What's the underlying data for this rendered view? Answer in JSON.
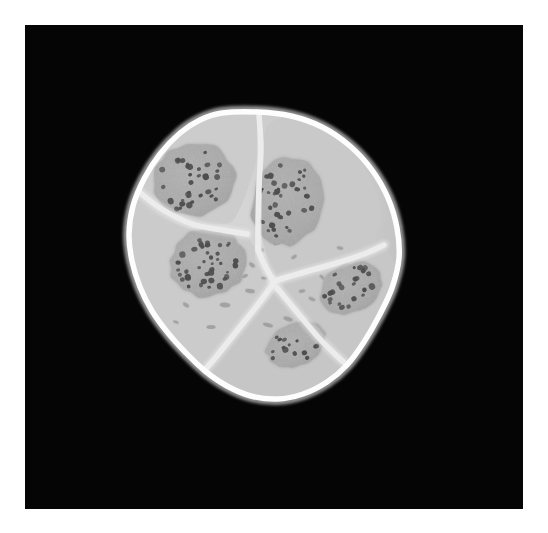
{
  "figure": {
    "modality": "grayscale light micrograph",
    "caption": "Cross-section of a five-celled embryo showing blastomeres separated by bright cell membranes, each containing a single darker nucleus with dense chromatin granules."
  },
  "canvas": {
    "width": 548,
    "height": 533,
    "page_background": "#ffffff"
  },
  "plate": {
    "x": 25,
    "y": 25,
    "width": 498,
    "height": 484,
    "background_color": "#050505",
    "label": "black specimen plate"
  },
  "palette": {
    "background_black": "#050505",
    "membrane_white": "#fdfdfd",
    "membrane_glow": "#f2f2f2",
    "cytoplasm_light": "#d2d2d2",
    "cytoplasm_mid": "#c4c4c4",
    "cytoplasm_shade": "#b4b4b4",
    "nucleus_fill": "#9a9a9a",
    "nucleus_edge": "#8d8d8d",
    "chromatin_dot": "#1a1a1a",
    "granule_speck": "#7c7c7c"
  },
  "specimen": {
    "name": "embryo-cluster",
    "outline_label": "embryo outer boundary",
    "center_x": 265,
    "center_y": 255,
    "bounds": {
      "x_min": 128,
      "y_min": 112,
      "x_max": 400,
      "y_max": 400
    },
    "outline_points": [
      [
        222,
        113
      ],
      [
        258,
        112
      ],
      [
        291,
        116
      ],
      [
        322,
        127
      ],
      [
        350,
        146
      ],
      [
        372,
        170
      ],
      [
        388,
        198
      ],
      [
        397,
        228
      ],
      [
        399,
        258
      ],
      [
        392,
        288
      ],
      [
        379,
        316
      ],
      [
        364,
        342
      ],
      [
        347,
        365
      ],
      [
        327,
        382
      ],
      [
        303,
        394
      ],
      [
        277,
        399
      ],
      [
        251,
        396
      ],
      [
        227,
        386
      ],
      [
        205,
        371
      ],
      [
        186,
        353
      ],
      [
        168,
        333
      ],
      [
        152,
        311
      ],
      [
        140,
        287
      ],
      [
        132,
        261
      ],
      [
        129,
        234
      ],
      [
        133,
        206
      ],
      [
        144,
        179
      ],
      [
        160,
        154
      ],
      [
        180,
        133
      ],
      [
        200,
        120
      ]
    ],
    "membrane_thickness": 5.5,
    "triple_junction": {
      "x": 275,
      "y": 283,
      "label": "central triple junction"
    }
  },
  "cells": [
    {
      "id": "cell-upper-left",
      "label": "Blastomere 1 (upper-left)",
      "cytoplasm_tone": "#cfcfcf",
      "region_points": [
        [
          200,
          121
        ],
        [
          228,
          114
        ],
        [
          252,
          117
        ],
        [
          264,
          130
        ],
        [
          258,
          155
        ],
        [
          250,
          182
        ],
        [
          241,
          206
        ],
        [
          231,
          222
        ],
        [
          212,
          224
        ],
        [
          188,
          220
        ],
        [
          163,
          212
        ],
        [
          145,
          201
        ],
        [
          138,
          186
        ],
        [
          142,
          166
        ],
        [
          155,
          145
        ],
        [
          173,
          129
        ]
      ],
      "nucleus": {
        "id": "nucleus-1",
        "label": "nucleus of upper-left blastomere",
        "cx": 194,
        "cy": 180,
        "rx": 41,
        "ry": 36,
        "rotation": -18,
        "chromatin_count": 34
      }
    },
    {
      "id": "cell-upper-right",
      "label": "Blastomere 2 (upper-right)",
      "cytoplasm_tone": "#cacaca",
      "region_points": [
        [
          266,
          129
        ],
        [
          283,
          118
        ],
        [
          310,
          123
        ],
        [
          338,
          140
        ],
        [
          360,
          163
        ],
        [
          375,
          190
        ],
        [
          381,
          216
        ],
        [
          374,
          240
        ],
        [
          356,
          253
        ],
        [
          330,
          262
        ],
        [
          303,
          271
        ],
        [
          283,
          278
        ],
        [
          272,
          272
        ],
        [
          265,
          250
        ],
        [
          260,
          222
        ],
        [
          259,
          193
        ],
        [
          261,
          160
        ]
      ],
      "nucleus": {
        "id": "nucleus-2",
        "label": "nucleus of upper-right blastomere",
        "cx": 287,
        "cy": 202,
        "rx": 35,
        "ry": 44,
        "rotation": 12,
        "chromatin_count": 38
      }
    },
    {
      "id": "cell-middle-left",
      "label": "Blastomere 3 (left)",
      "cytoplasm_tone": "#cdcdcd",
      "region_points": [
        [
          136,
          192
        ],
        [
          143,
          208
        ],
        [
          166,
          220
        ],
        [
          193,
          229
        ],
        [
          220,
          232
        ],
        [
          240,
          232
        ],
        [
          252,
          243
        ],
        [
          260,
          266
        ],
        [
          266,
          288
        ],
        [
          256,
          308
        ],
        [
          238,
          330
        ],
        [
          219,
          352
        ],
        [
          203,
          368
        ],
        [
          184,
          354
        ],
        [
          164,
          331
        ],
        [
          148,
          307
        ],
        [
          136,
          281
        ],
        [
          130,
          253
        ],
        [
          129,
          223
        ]
      ],
      "nucleus": {
        "id": "nucleus-3",
        "label": "nucleus of left blastomere",
        "cx": 208,
        "cy": 263,
        "rx": 38,
        "ry": 34,
        "rotation": -8,
        "chromatin_count": 40
      }
    },
    {
      "id": "cell-right",
      "label": "Blastomere 4 (right)",
      "cytoplasm_tone": "#c8c8c8",
      "region_points": [
        [
          285,
          282
        ],
        [
          308,
          274
        ],
        [
          336,
          265
        ],
        [
          361,
          257
        ],
        [
          379,
          246
        ],
        [
          390,
          254
        ],
        [
          396,
          274
        ],
        [
          390,
          297
        ],
        [
          378,
          321
        ],
        [
          364,
          344
        ],
        [
          348,
          360
        ],
        [
          331,
          350
        ],
        [
          312,
          333
        ],
        [
          296,
          314
        ],
        [
          285,
          296
        ]
      ],
      "nucleus": {
        "id": "nucleus-4",
        "label": "nucleus of right blastomere",
        "cx": 351,
        "cy": 288,
        "rx": 32,
        "ry": 24,
        "rotation": -28,
        "chromatin_count": 24
      }
    },
    {
      "id": "cell-bottom",
      "label": "Blastomere 5 (bottom)",
      "cytoplasm_tone": "#c6c6c6",
      "region_points": [
        [
          208,
          370
        ],
        [
          225,
          386
        ],
        [
          249,
          396
        ],
        [
          276,
          400
        ],
        [
          302,
          394
        ],
        [
          325,
          383
        ],
        [
          343,
          365
        ],
        [
          327,
          348
        ],
        [
          308,
          329
        ],
        [
          291,
          310
        ],
        [
          278,
          292
        ],
        [
          268,
          300
        ],
        [
          252,
          318
        ],
        [
          234,
          340
        ],
        [
          219,
          358
        ]
      ],
      "nucleus": {
        "id": "nucleus-5",
        "label": "nucleus of bottom blastomere",
        "cx": 296,
        "cy": 345,
        "rx": 31,
        "ry": 21,
        "rotation": -22,
        "chromatin_count": 14
      }
    }
  ],
  "membranes": [
    {
      "id": "membrane-1-3",
      "label": "membrane between upper-left and left blastomeres",
      "points": [
        [
          137,
          190
        ],
        [
          160,
          208
        ],
        [
          192,
          224
        ],
        [
          222,
          230
        ],
        [
          247,
          234
        ]
      ]
    },
    {
      "id": "membrane-1-2",
      "label": "membrane between upper-left and upper-right blastomeres",
      "points": [
        [
          259,
          115
        ],
        [
          261,
          148
        ],
        [
          259,
          185
        ],
        [
          258,
          222
        ],
        [
          258,
          250
        ]
      ]
    },
    {
      "id": "membrane-2-34",
      "label": "membrane from upper-right to central junction",
      "points": [
        [
          258,
          250
        ],
        [
          265,
          266
        ],
        [
          273,
          280
        ]
      ]
    },
    {
      "id": "membrane-3-5",
      "label": "membrane between left and bottom blastomeres",
      "points": [
        [
          273,
          284
        ],
        [
          256,
          307
        ],
        [
          236,
          332
        ],
        [
          216,
          357
        ],
        [
          203,
          372
        ]
      ]
    },
    {
      "id": "membrane-24-right",
      "label": "membrane between upper-right and right blastomeres",
      "points": [
        [
          274,
          281
        ],
        [
          305,
          272
        ],
        [
          337,
          263
        ],
        [
          364,
          254
        ],
        [
          384,
          245
        ]
      ]
    },
    {
      "id": "membrane-4-5",
      "label": "membrane between right and bottom blastomeres",
      "points": [
        [
          277,
          288
        ],
        [
          297,
          312
        ],
        [
          318,
          337
        ],
        [
          339,
          358
        ],
        [
          350,
          367
        ]
      ]
    }
  ],
  "cytoplasm_granules": [
    {
      "cx": 260,
      "cy": 249,
      "rx": 4.5,
      "ry": 2.2,
      "rot": 30
    },
    {
      "cx": 277,
      "cy": 243,
      "rx": 4.0,
      "ry": 2.0,
      "rot": -15
    },
    {
      "cx": 252,
      "cy": 265,
      "rx": 3.5,
      "ry": 1.9,
      "rot": 40
    },
    {
      "cx": 264,
      "cy": 278,
      "rx": 3.0,
      "ry": 1.6,
      "rot": 10
    },
    {
      "cx": 265,
      "cy": 236,
      "rx": 3.2,
      "ry": 1.7,
      "rot": 55
    },
    {
      "cx": 250,
      "cy": 291,
      "rx": 5.0,
      "ry": 2.2,
      "rot": 8
    },
    {
      "cx": 225,
      "cy": 305,
      "rx": 5.5,
      "ry": 2.4,
      "rot": 5
    },
    {
      "cx": 186,
      "cy": 305,
      "rx": 3.6,
      "ry": 1.9,
      "rot": 35
    },
    {
      "cx": 176,
      "cy": 322,
      "rx": 3.0,
      "ry": 1.6,
      "rot": 20
    },
    {
      "cx": 211,
      "cy": 327,
      "rx": 4.6,
      "ry": 2.0,
      "rot": 0
    },
    {
      "cx": 245,
      "cy": 276,
      "rx": 3.2,
      "ry": 1.7,
      "rot": -25
    },
    {
      "cx": 288,
      "cy": 319,
      "rx": 4.8,
      "ry": 2.2,
      "rot": 18
    },
    {
      "cx": 302,
      "cy": 291,
      "rx": 3.4,
      "ry": 1.8,
      "rot": -10
    },
    {
      "cx": 322,
      "cy": 277,
      "rx": 3.0,
      "ry": 1.6,
      "rot": 45
    },
    {
      "cx": 312,
      "cy": 299,
      "rx": 3.8,
      "ry": 1.8,
      "rot": 25
    },
    {
      "cx": 294,
      "cy": 257,
      "rx": 3.2,
      "ry": 1.7,
      "rot": -35
    },
    {
      "cx": 340,
      "cy": 248,
      "rx": 3.4,
      "ry": 1.8,
      "rot": 12
    },
    {
      "cx": 268,
      "cy": 325,
      "rx": 5.2,
      "ry": 2.0,
      "rot": 15
    },
    {
      "cx": 238,
      "cy": 247,
      "rx": 3.0,
      "ry": 1.5,
      "rot": -20
    },
    {
      "cx": 196,
      "cy": 289,
      "rx": 3.4,
      "ry": 1.7,
      "rot": 30
    }
  ],
  "annotations": {
    "visible_text": [],
    "note": "No visible text, axes, scale bar, or labels appear in the screenshot."
  }
}
